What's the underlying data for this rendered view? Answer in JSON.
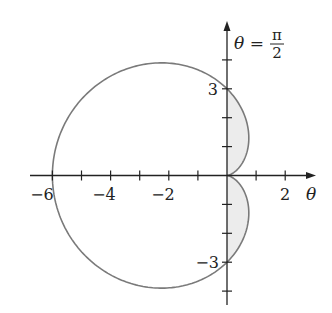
{
  "chart_data": {
    "type": "line",
    "subtype": "polar-curve",
    "equation": "r = 3 - 3cos(θ)",
    "x_axis": {
      "label": "θ",
      "ticks": [
        -6,
        -5,
        -4,
        -3,
        -2,
        -1,
        0,
        1,
        2
      ],
      "tick_labels": [
        "-6",
        "-4",
        "-2",
        "2"
      ],
      "range": [
        -6.5,
        3.0
      ]
    },
    "y_axis": {
      "label": "θ = π/2",
      "ticks": [
        -4,
        -3,
        -2,
        -1,
        0,
        1,
        2,
        3,
        4
      ],
      "tick_labels": [
        "3",
        "-3"
      ],
      "range": [
        -4.4,
        5.3
      ]
    },
    "key_points": [
      {
        "theta": "0",
        "r": 0,
        "x": 0,
        "y": 0
      },
      {
        "theta": "π/2",
        "r": 3,
        "x": 0,
        "y": 3
      },
      {
        "theta": "π",
        "r": 6,
        "x": -6,
        "y": 0
      },
      {
        "theta": "3π/2",
        "r": 3,
        "x": 0,
        "y": -3
      }
    ],
    "shaded_region": "area enclosed by the cardioid where x ≥ 0 (two lobes, 0 ≤ θ ≤ π/2 and 3π/2 ≤ θ ≤ 2π)",
    "grid": false,
    "legend": null
  },
  "labels": {
    "axis_title_theta": "θ",
    "axis_title_vertical_lhs": "θ =",
    "pi": "π",
    "two": "2",
    "x_neg6": "−6",
    "x_neg4": "−4",
    "x_neg2": "−2",
    "x_2": "2",
    "y_3": "3",
    "y_neg3": "−3"
  },
  "colors": {
    "curve": "#7a7a7a",
    "shade": "#ececec",
    "axis": "#222222"
  }
}
